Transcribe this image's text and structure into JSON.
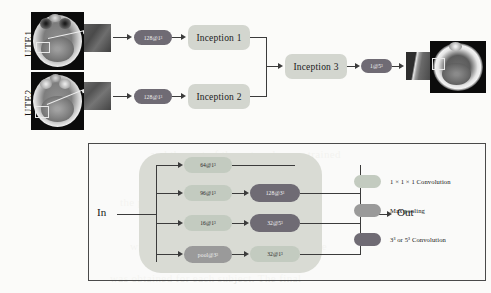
{
  "figure": {
    "inputs": [
      {
        "label": "UTE1"
      },
      {
        "label": "UTE2"
      }
    ],
    "stage1_convs": [
      {
        "label": "128@1³"
      },
      {
        "label": "128@1³"
      }
    ],
    "inception_blocks": [
      {
        "label": "Inception 1"
      },
      {
        "label": "Inception 2"
      },
      {
        "label": "Inception 3"
      }
    ],
    "output_conv": {
      "label": "1@5³"
    }
  },
  "module": {
    "in_label": "In",
    "out_label": "Out",
    "branches": [
      {
        "first": {
          "label": "64@1³",
          "kind": "conv1"
        },
        "second": null
      },
      {
        "first": {
          "label": "96@1³",
          "kind": "conv1"
        },
        "second": {
          "label": "128@3³",
          "kind": "conv35"
        }
      },
      {
        "first": {
          "label": "16@1³",
          "kind": "conv1"
        },
        "second": {
          "label": "32@5³",
          "kind": "conv35"
        }
      },
      {
        "first": {
          "label": "pool@3³",
          "kind": "pool"
        },
        "second": {
          "label": "32@1³",
          "kind": "conv1"
        }
      }
    ]
  },
  "legend": [
    {
      "swatch": "#c3cbc0",
      "text": "1 × 1 × 1 Convolution"
    },
    {
      "swatch": "#9a9a9a",
      "text": "Max pooling"
    },
    {
      "swatch": "#6f6b74",
      "text": "3³ or 5³ Convolution"
    }
  ],
  "colors": {
    "conv1": "#c3cbc0",
    "pool": "#9a9a9a",
    "conv35": "#6f6b74",
    "inception_box": "#d3d6cf",
    "module_blob": "#d9dbd4",
    "line": "#3b3b3b",
    "panel_border": "#4a4a4a"
  },
  "background_text": [
    "and the rest of the network were trained",
    "the proposed method was evaluated using",
    "with a reference CT acquired in the same",
    "was obtained for each subject. The final"
  ]
}
